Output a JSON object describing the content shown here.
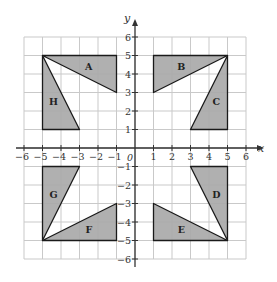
{
  "diagram": {
    "type": "coordinate-grid",
    "axes": {
      "x_label": "x",
      "y_label": "y",
      "origin_label": "0",
      "x_range": [
        -6,
        6
      ],
      "y_range": [
        -6,
        6
      ],
      "x_ticks": [
        "−6",
        "−5",
        "−4",
        "−3",
        "−2",
        "−1",
        "1",
        "2",
        "3",
        "4",
        "5",
        "6"
      ],
      "y_ticks": [
        "6",
        "5",
        "4",
        "3",
        "2",
        "1",
        "−1",
        "−2",
        "−3",
        "−4",
        "−5",
        "−6"
      ]
    },
    "colors": {
      "fill": "#a9a9a9",
      "stroke": "#1a1a1a",
      "grid": "#c9c9c9",
      "axis": "#333333"
    },
    "triangles": [
      {
        "label": "A",
        "vertices": [
          [
            -5,
            5
          ],
          [
            -1,
            5
          ],
          [
            -1,
            3
          ]
        ],
        "label_pos": [
          -2.5,
          4.4
        ]
      },
      {
        "label": "B",
        "vertices": [
          [
            1,
            5
          ],
          [
            5,
            5
          ],
          [
            1,
            3
          ]
        ],
        "label_pos": [
          2.5,
          4.4
        ]
      },
      {
        "label": "C",
        "vertices": [
          [
            5,
            5
          ],
          [
            5,
            1
          ],
          [
            3,
            1
          ]
        ],
        "label_pos": [
          4.4,
          2.5
        ]
      },
      {
        "label": "D",
        "vertices": [
          [
            3,
            -1
          ],
          [
            5,
            -1
          ],
          [
            5,
            -5
          ]
        ],
        "label_pos": [
          4.4,
          -2.5
        ]
      },
      {
        "label": "E",
        "vertices": [
          [
            1,
            -3
          ],
          [
            1,
            -5
          ],
          [
            5,
            -5
          ]
        ],
        "label_pos": [
          2.5,
          -4.4
        ]
      },
      {
        "label": "F",
        "vertices": [
          [
            -5,
            -5
          ],
          [
            -1,
            -5
          ],
          [
            -1,
            -3
          ]
        ],
        "label_pos": [
          -2.5,
          -4.4
        ]
      },
      {
        "label": "G",
        "vertices": [
          [
            -5,
            -1
          ],
          [
            -3,
            -1
          ],
          [
            -5,
            -5
          ]
        ],
        "label_pos": [
          -4.4,
          -2.5
        ]
      },
      {
        "label": "H",
        "vertices": [
          [
            -5,
            5
          ],
          [
            -5,
            1
          ],
          [
            -3,
            1
          ]
        ],
        "label_pos": [
          -4.4,
          2.5
        ]
      }
    ]
  }
}
